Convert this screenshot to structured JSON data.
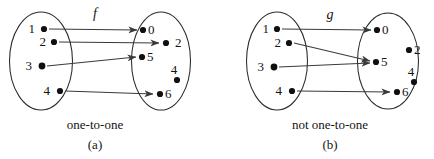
{
  "figure": {
    "title_visible": false,
    "panels": [
      {
        "id": "a",
        "function_label": "f",
        "caption": "one-to-one",
        "panel_tag": "(a)",
        "domain": {
          "name": "domain-set",
          "elements": [
            {
              "label": "1",
              "cx": 44,
              "cy": 29,
              "label_x": 35,
              "label_y": 33
            },
            {
              "label": "2",
              "cx": 54,
              "cy": 42,
              "label_x": 45,
              "label_y": 46
            },
            {
              "label": "3",
              "cx": 42,
              "cy": 66,
              "label_x": 30,
              "label_y": 70
            },
            {
              "label": "4",
              "cx": 60,
              "cy": 91,
              "label_x": 48,
              "label_y": 95
            }
          ]
        },
        "codomain": {
          "name": "codomain-set",
          "elements": [
            {
              "label": "0",
              "cx": 143,
              "cy": 30,
              "label_x": 149,
              "label_y": 34
            },
            {
              "label": "2",
              "cx": 166,
              "cy": 43,
              "label_x": 175,
              "label_y": 47
            },
            {
              "label": "5",
              "cx": 142,
              "cy": 57,
              "label_x": 148,
              "label_y": 61
            },
            {
              "label": "4",
              "cx": 177,
              "cy": 80,
              "label_x": 170,
              "label_y": 74
            },
            {
              "label": "6",
              "cx": 160,
              "cy": 94,
              "label_x": 166,
              "label_y": 98
            }
          ]
        },
        "mappings": [
          {
            "from": "1",
            "to": "0"
          },
          {
            "from": "2",
            "to": "2"
          },
          {
            "from": "3",
            "to": "5"
          },
          {
            "from": "4",
            "to": "6"
          }
        ]
      },
      {
        "id": "b",
        "function_label": "g",
        "caption": "not one-to-one",
        "panel_tag": "(b)",
        "domain": {
          "name": "domain-set",
          "elements": [
            {
              "label": "1",
              "cx": 277,
              "cy": 29,
              "label_x": 268,
              "label_y": 33
            },
            {
              "label": "2",
              "cx": 289,
              "cy": 43,
              "label_x": 280,
              "label_y": 47
            },
            {
              "label": "3",
              "cx": 274,
              "cy": 67,
              "label_x": 262,
              "label_y": 71
            },
            {
              "label": "4",
              "cx": 292,
              "cy": 91,
              "label_x": 280,
              "label_y": 95
            }
          ]
        },
        "codomain": {
          "name": "codomain-set",
          "elements": [
            {
              "label": "0",
              "cx": 377,
              "cy": 30,
              "label_x": 383,
              "label_y": 34
            },
            {
              "label": "2",
              "cx": 409,
              "cy": 50,
              "label_x": 415,
              "label_y": 54
            },
            {
              "label": "5",
              "cx": 376,
              "cy": 62,
              "label_x": 382,
              "label_y": 66
            },
            {
              "label": "4",
              "cx": 414,
              "cy": 82,
              "label_x": 407,
              "label_y": 76
            },
            {
              "label": "6",
              "cx": 397,
              "cy": 92,
              "label_x": 403,
              "label_y": 96
            }
          ]
        },
        "mappings": [
          {
            "from": "1",
            "to": "0"
          },
          {
            "from": "2",
            "to": "5"
          },
          {
            "from": "3",
            "to": "5"
          },
          {
            "from": "4",
            "to": "6"
          }
        ]
      }
    ],
    "colors": {
      "stroke": "#2b2b2b",
      "edge": "#3a3a3a",
      "dot": "#101010",
      "text": "#141414",
      "background": "#ffffff"
    }
  }
}
